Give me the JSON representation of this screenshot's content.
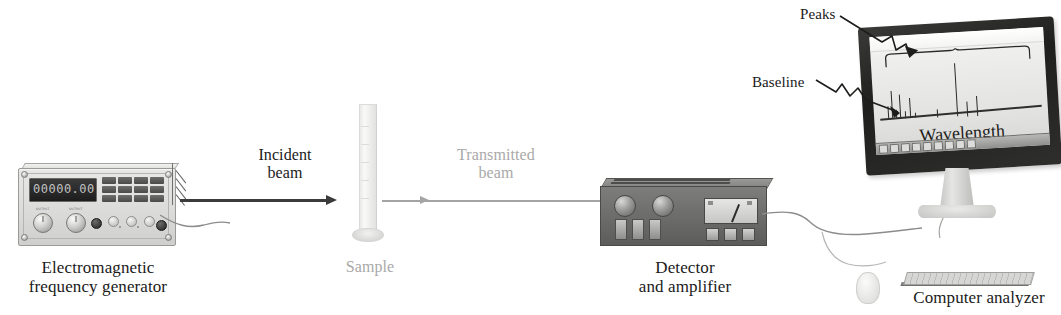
{
  "figure": {
    "type": "instrument-schematic",
    "background_color": "#ffffff"
  },
  "labels": {
    "generator": "Electromagnetic\nfrequency generator",
    "incident_beam": "Incident\nbeam",
    "sample": "Sample",
    "transmitted_beam": "Transmitted\nbeam",
    "detector": "Detector\nand amplifier",
    "computer": "Computer analyzer",
    "peaks_callout": "Peaks",
    "baseline_callout": "Baseline",
    "screen_axis": "Wavelength"
  },
  "colors": {
    "incident_beam": "#3b3b3b",
    "transmitted_beam": "#a4a4a4",
    "dark_text": "#1a1a1a",
    "dim_text": "#a9a9a9",
    "detector_body": "#6b6b69",
    "monitor_bezel": "#2a2a28",
    "screen": "#ececea"
  },
  "generator": {
    "display_value": "00000.00",
    "button_rows": 3,
    "button_cols": 4,
    "large_knob_count": 2,
    "small_knob_count": 3,
    "dark_knob_count": 2,
    "knob_caption_left": "OUTPUT",
    "knob_caption_right": "OUTPUT"
  },
  "detector": {
    "knob_count": 2,
    "slider_count": 3,
    "small_button_count": 3,
    "meter_needle_angle_deg": 22
  },
  "chart_data": {
    "type": "bar",
    "title": "",
    "xlabel": "Wavelength",
    "ylabel": "",
    "grid": false,
    "legend": null,
    "annotations": [
      "Peaks",
      "Baseline"
    ],
    "categories": [
      "p1",
      "p2",
      "p3",
      "p4",
      "p5",
      "p6",
      "p7",
      "p8",
      "p9",
      "p10",
      "p11"
    ],
    "x": [
      14,
      18,
      22,
      26,
      31,
      36,
      41,
      63,
      83,
      93,
      103
    ],
    "values": [
      14,
      30,
      9,
      26,
      7,
      22,
      6,
      9,
      58,
      16,
      22
    ],
    "xlim": [
      0,
      174
    ],
    "ylim": [
      0,
      70
    ]
  },
  "screen": {
    "titlebar": true,
    "taskbar_icon_count": 9
  }
}
